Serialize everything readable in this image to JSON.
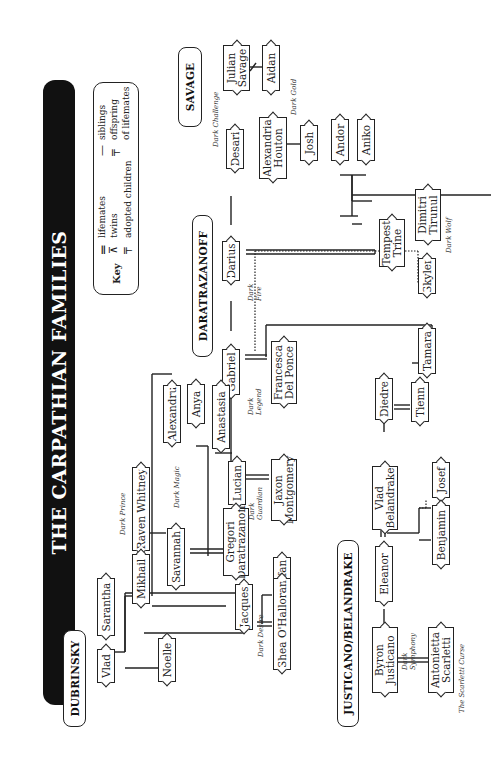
{
  "title": "THE CARPATHIAN FAMILIES",
  "key": {
    "label": "Key",
    "entries": [
      {
        "symbol": "lifemates-symbol",
        "text": "lifemates"
      },
      {
        "symbol": "twins-symbol",
        "text": "twins"
      },
      {
        "symbol": "adopted-symbol",
        "text": "adopted children"
      },
      {
        "symbol": "siblings-symbol",
        "text": "siblings"
      },
      {
        "symbol": "offspring-symbol",
        "text": "offspring"
      },
      {
        "symbol": "offspring-symbol-cont",
        "text": "of lifemates"
      }
    ]
  },
  "families": {
    "savage": "SAVAGE",
    "daratrazanoff": "DARATRAZANOFF",
    "dubrinsky": "DUBRINSKY",
    "justicano_belandrake": "JUSTICANO/BELANDRAKE"
  },
  "people": {
    "julian_savage": "Julian Savage",
    "aidan": "Aidan",
    "desari": "Desari",
    "alexandria_houton": "Alexandria Houton",
    "josh": "Josh",
    "andor": "Andor",
    "aniko": "Aniko",
    "darius": "Darius",
    "tempest_trine": "Tempest Trine",
    "dimitri_tirunul": "Dimitri Tirunul",
    "skyler": "Skyler",
    "tamara": "Tamara",
    "gabriel": "Gabriel",
    "francesca_del_ponce": "Francesca Del Ponce",
    "alexandru": "Alexandru",
    "anya": "Anya",
    "anastasia": "Anastasia",
    "lucian": "Lucian",
    "jaxon_montgomery": "Jaxon Montgomery",
    "raven_whitney": "Raven Whitney",
    "mikhail": "Mikhail",
    "savannah": "Savannah",
    "gregori_daratrazanoff": "Gregori Daratrazanoff",
    "stefan": "Stefan",
    "sarantha": "Sarantha",
    "vlad": "Vlad",
    "noelle": "Noelle",
    "jacques": "Jacques",
    "shea_ohalloran": "Shea O'Halloran",
    "diedre": "Diedre",
    "tienn": "Tienn",
    "vlad_belandrake": "Vlad Belandrake",
    "josef": "Josef",
    "benjamin": "Benjamin",
    "eleanor": "Eleanor",
    "byron_justicano": "Byron Justicano",
    "antonietta_scarletti": "Antonietta Scarletti"
  },
  "books": {
    "dark_challenge": "Dark Challenge",
    "dark_gold": "Dark Gold",
    "dark_fire": "Dark Fire",
    "dark_legend": "Dark Legend",
    "dark_wolf": "Dark Wolf",
    "dark_guardian": "Dark Guardian",
    "dark_prince": "Dark Prince",
    "dark_magic": "Dark Magic",
    "dark_desire": "Dark Desire",
    "dark_symphony": "Dark Symphony",
    "the_scarletti_curse": "The Scarletti Curse"
  }
}
